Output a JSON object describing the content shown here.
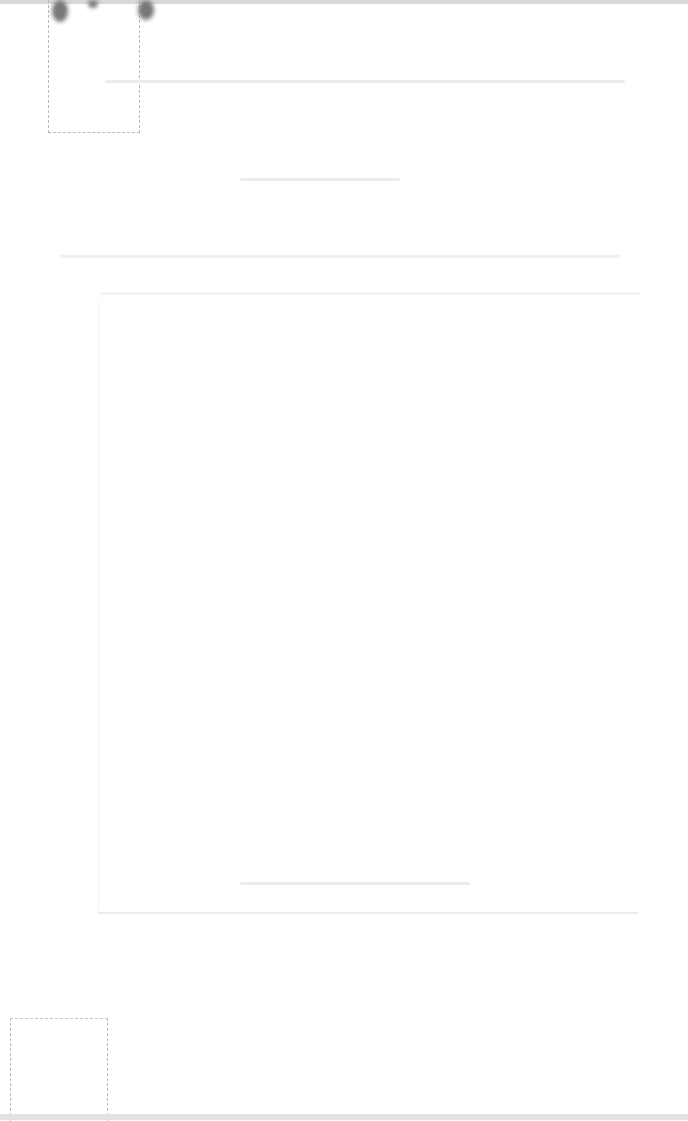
{
  "page": {
    "type": "scanned document page",
    "legibility": "text too faded to read",
    "text_lines": [
      {
        "id": "line-1",
        "text": ""
      },
      {
        "id": "line-2",
        "text": ""
      },
      {
        "id": "line-3",
        "text": ""
      },
      {
        "id": "line-4",
        "text": ""
      }
    ]
  },
  "colors": {
    "background": "#ffffff",
    "marks": "#777777"
  }
}
